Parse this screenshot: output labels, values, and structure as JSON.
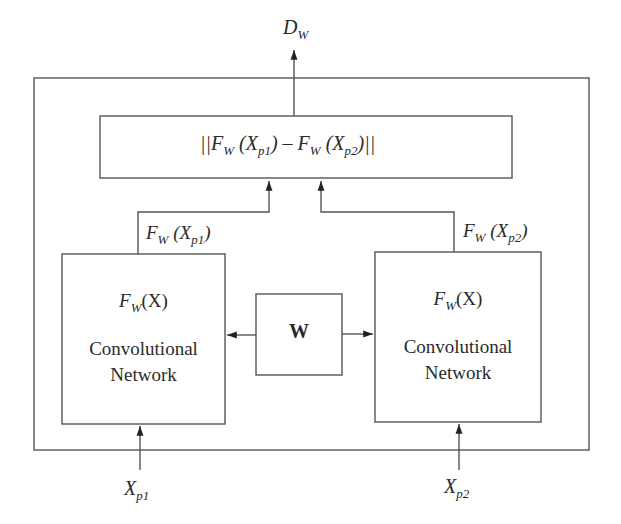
{
  "diagram": {
    "output": {
      "symbol": "D",
      "subscript": "W"
    },
    "distance_box": {
      "label_parts": [
        "||F",
        "W",
        " (X",
        "p1",
        ") – F",
        "W",
        " (X",
        "p2",
        ")||"
      ]
    },
    "left_branch": {
      "output_label": {
        "f": "F",
        "f_sub": "W",
        "x": "X",
        "x_sub": "p1"
      },
      "function": {
        "f": "F",
        "f_sub": "W",
        "arg": "(X)"
      },
      "name_line1": "Convolutional",
      "name_line2": "Network",
      "input": {
        "symbol": "X",
        "subscript": "p1"
      }
    },
    "right_branch": {
      "output_label": {
        "f": "F",
        "f_sub": "W",
        "x": "X",
        "x_sub": "p2"
      },
      "function": {
        "f": "F",
        "f_sub": "W",
        "arg": "(X)"
      },
      "name_line1": "Convolutional",
      "name_line2": "Network",
      "input": {
        "symbol": "X",
        "subscript": "p2"
      }
    },
    "shared_weights": {
      "label": "W"
    },
    "colors": {
      "line": "#555555",
      "text": "#2a2a2a",
      "background": "#ffffff"
    }
  }
}
